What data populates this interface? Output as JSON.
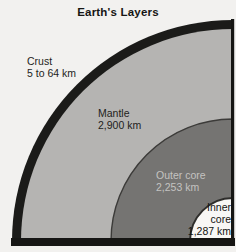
{
  "title": "Earth's Layers",
  "background_color": "#f2f1ef",
  "frame_color": "#161614",
  "layers": [
    {
      "name": "Crust",
      "thickness": "5 to 64 km",
      "color": "#1b1b19"
    },
    {
      "name": "Mantle",
      "thickness": "2,900 km",
      "color": "#b5b4b2"
    },
    {
      "name": "Outer core",
      "thickness": "2,253 km",
      "color": "#757472",
      "label_color": "#c4c3c1"
    },
    {
      "name": "Inner core",
      "name_lines": [
        "Inner",
        "core"
      ],
      "thickness": "1,287 km",
      "color": "#f8f7f5"
    }
  ]
}
